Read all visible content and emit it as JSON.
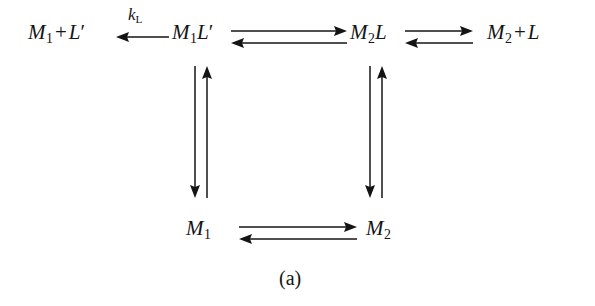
{
  "figure": {
    "caption": "(a)",
    "background_color": "#ffffff",
    "ink_color": "#141414",
    "type": "reaction-scheme"
  },
  "species": {
    "top_left": {
      "base": "M",
      "sub": "1",
      "op": "+",
      "partner": "L",
      "prime": "′",
      "full": "M1 + L′"
    },
    "top_mid_left": {
      "base": "M",
      "sub": "1",
      "ligand": "L",
      "prime": "′",
      "full": "M1L′"
    },
    "top_mid_right": {
      "base": "M",
      "sub": "2",
      "ligand": "L",
      "full": "M2L"
    },
    "top_right": {
      "base": "M",
      "sub": "2",
      "op": "+",
      "partner": "L",
      "full": "M2 + L"
    },
    "bottom_left": {
      "base": "M",
      "sub": "1",
      "full": "M1"
    },
    "bottom_right": {
      "base": "M",
      "sub": "2",
      "full": "M2"
    }
  },
  "labels": {
    "k_L": {
      "symbol": "k",
      "sub": "L",
      "full": "kL"
    }
  },
  "arrows": {
    "dissociation_left": {
      "direction": "left",
      "kind": "single",
      "label": "kL"
    },
    "top_middle": {
      "direction": "both",
      "kind": "double",
      "label": ""
    },
    "top_right": {
      "direction": "both",
      "kind": "double",
      "label": ""
    },
    "left_vertical": {
      "direction": "both",
      "kind": "double-vertical",
      "label": ""
    },
    "right_vertical": {
      "direction": "both",
      "kind": "double-vertical",
      "label": ""
    },
    "bottom": {
      "direction": "both",
      "kind": "double",
      "label": ""
    }
  }
}
